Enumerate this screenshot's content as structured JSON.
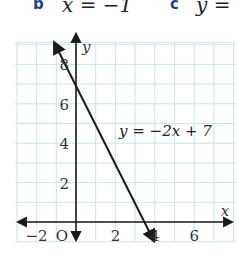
{
  "header": {
    "parts": [
      {
        "letter": "b",
        "equation": "x = −1"
      },
      {
        "letter": "c",
        "equation": "y ="
      }
    ]
  },
  "colors": {
    "grid": "#c9e6ee",
    "axis": "#1a1a1a",
    "line": "#1a1a1a",
    "part_letter": "#1f3f8f"
  },
  "chart_data": {
    "type": "line",
    "title": "",
    "xlabel": "x",
    "ylabel": "y",
    "xlim": [
      -3,
      8
    ],
    "ylim": [
      -1,
      9
    ],
    "grid": true,
    "origin_label": "O",
    "x_ticks": [
      -2,
      2,
      4,
      6
    ],
    "x_tick_labels": [
      "−2",
      "2",
      "4",
      "6"
    ],
    "y_ticks": [
      2,
      4,
      6,
      8
    ],
    "y_tick_labels": [
      "2",
      "4",
      "6",
      "8"
    ],
    "series": [
      {
        "name": "y = −2x + 7",
        "equation": "y = −2x + 7",
        "slope": -2,
        "intercept": 7,
        "x": [
          -1,
          0,
          3.5,
          4
        ],
        "y": [
          9,
          7,
          0,
          -1
        ]
      }
    ],
    "annotations": [
      {
        "text": "y = −2x + 7",
        "x": 2.2,
        "y": 4.4
      }
    ]
  }
}
